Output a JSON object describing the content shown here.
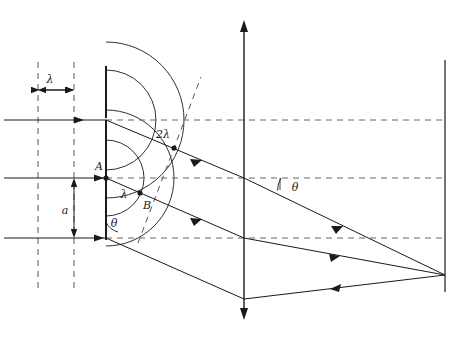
{
  "figure": {
    "type": "optics-ray-diagram",
    "width": 471,
    "height": 348,
    "background_color": "#ffffff",
    "stroke_color": "#1a1a1a",
    "dashed_color": "#4d4d4d"
  },
  "labels": {
    "wavelength_incident": "λ",
    "path_difference_full": "2λ",
    "path_difference_half": "λ",
    "slit_width": "a",
    "point_a": "A",
    "point_b": "B",
    "angle_at_slit": "θ",
    "angle_at_axis": "θ"
  },
  "geometry": {
    "barrier_x": 106,
    "lens_axis_x": 244,
    "screen_x": 445,
    "slit_top_y": 120,
    "slit_center_y": 178,
    "slit_bottom_y": 238,
    "focal_point_x": 445,
    "focal_point_y": 275,
    "incident_wavefront_x": [
      38,
      74
    ],
    "wavelength_bracket_y": 90,
    "slit_width_bracket_x": 74
  },
  "annotations": {
    "incident_rays_count": 3,
    "diffracted_rays_count": 3,
    "wavefront_arcs_count": 4,
    "incident_wavefront_lines": 2
  }
}
